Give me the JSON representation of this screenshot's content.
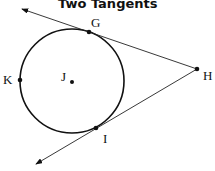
{
  "title": "Two Tangents",
  "points": {
    "G": "G",
    "H": "H",
    "I": "I",
    "J": "J",
    "K": "K"
  },
  "colors": {
    "stroke": "#111111"
  }
}
